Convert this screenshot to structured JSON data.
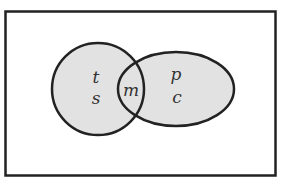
{
  "diagram": {
    "type": "venn",
    "universe": {
      "label": ""
    },
    "sets": [
      {
        "name": "left-circle",
        "only_elements": [
          "t",
          "s"
        ]
      },
      {
        "name": "right-ellipse",
        "only_elements": [
          "p",
          "c"
        ]
      }
    ],
    "intersection": [
      "m"
    ],
    "labels": {
      "t": "t",
      "s": "s",
      "m": "m",
      "p": "p",
      "c": "c"
    },
    "colors": {
      "fill": "#e2e2e2",
      "stroke": "#222222",
      "background": "#ffffff"
    }
  }
}
